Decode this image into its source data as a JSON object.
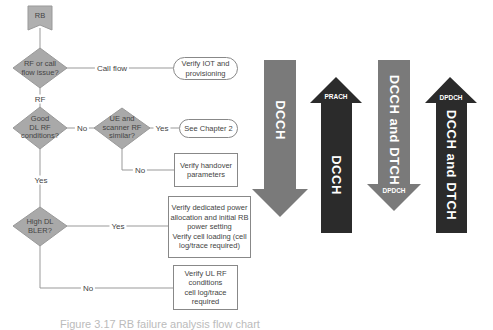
{
  "flowchart": {
    "start": {
      "label": "RB"
    },
    "decisions": [
      {
        "id": "rf-or-call-flow",
        "lines": [
          "RF or call",
          "flow issue?"
        ]
      },
      {
        "id": "good-dl-rf",
        "lines": [
          "Good",
          "DL RF",
          "conditions?"
        ]
      },
      {
        "id": "ue-scanner-similar",
        "lines": [
          "UE and",
          "scanner RF",
          "similar?"
        ]
      },
      {
        "id": "high-dl-bler",
        "lines": [
          "High DL",
          "BLER?"
        ]
      }
    ],
    "edge_labels": {
      "call_flow": "Call flow",
      "rf": "RF",
      "no_dl": "No",
      "yes_ue": "Yes",
      "no_ue": "No",
      "yes_dl": "Yes",
      "yes_bler": "Yes",
      "no_bler": "No"
    },
    "terminals": [
      {
        "id": "verify-iot",
        "lines": [
          "Verify IOT and",
          "provisioning"
        ]
      },
      {
        "id": "see-chapter-2",
        "lines": [
          "See Chapter 2"
        ]
      }
    ],
    "actions": [
      {
        "id": "verify-handover",
        "lines": [
          "Verify handover",
          "parameters"
        ]
      },
      {
        "id": "verify-dedicated-power",
        "lines": [
          "Verify dedicated power",
          "allocation and initial RB",
          "power setting",
          "Verify cell loading (cell",
          "log/trace required)"
        ]
      },
      {
        "id": "verify-ul-rf",
        "lines": [
          "Verify UL RF",
          "conditions",
          "cell log/trace",
          "required"
        ]
      }
    ]
  },
  "channel_arrows": [
    {
      "direction": "down",
      "shade": "gray",
      "main_label": "DCCH",
      "sub_label": ""
    },
    {
      "direction": "up",
      "shade": "dark",
      "main_label": "DCCH",
      "sub_label": "PRACH"
    },
    {
      "direction": "down",
      "shade": "gray",
      "main_label": "DCCH and DTCH",
      "sub_label": "DPDCH"
    },
    {
      "direction": "up",
      "shade": "dark",
      "main_label": "DCCH and DTCH",
      "sub_label": "DPDCH"
    }
  ],
  "colors": {
    "diamond_fill": "#a9a9a9",
    "arrow_gray": "#7a7a7a",
    "arrow_dark": "#2b2b2b",
    "line": "#999999"
  },
  "caption": "Figure 3.17  RB failure analysis flow chart"
}
